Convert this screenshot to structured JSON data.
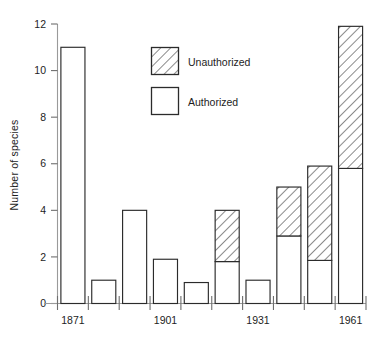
{
  "chart_data": {
    "type": "bar",
    "title": "",
    "subtitle": "",
    "xlabel": "",
    "ylabel": "Number of species",
    "ylim": [
      0,
      12
    ],
    "xlim": [
      1861,
      1971
    ],
    "grid": false,
    "stacked": true,
    "legend_position": "upper-center",
    "y_ticks": [
      "0",
      "2",
      "4",
      "6",
      "8",
      "10",
      "12"
    ],
    "y_tick_values": [
      0,
      2,
      4,
      6,
      8,
      10,
      12
    ],
    "x_tick_labels": [
      "1871",
      "1901",
      "1931",
      "1961"
    ],
    "x_tick_values": [
      1871,
      1901,
      1931,
      1961
    ],
    "categories": [
      "1871",
      "1881",
      "1891",
      "1901",
      "1911",
      "1921",
      "1931",
      "1941",
      "1951",
      "1961"
    ],
    "series": [
      {
        "name": "Authorized",
        "fill": "white",
        "values": [
          11,
          1,
          4,
          1.9,
          0.9,
          1.8,
          1,
          2.9,
          1.85,
          5.8
        ]
      },
      {
        "name": "Unauthorized",
        "fill": "hatched",
        "values": [
          0,
          0,
          0,
          0,
          0,
          2.2,
          0,
          2.1,
          4.05,
          6.1
        ]
      }
    ],
    "totals": [
      11,
      1,
      4,
      1.9,
      0.9,
      4,
      1,
      5,
      5.9,
      11.9
    ],
    "legend": [
      {
        "label": "Unauthorized",
        "swatch": "hatched"
      },
      {
        "label": "Authorized",
        "swatch": "white"
      }
    ]
  },
  "colors": {
    "background": "#ffffff",
    "ink": "#2b2b2b",
    "axis": "#9a9a9a",
    "text": "#1d1d1d"
  }
}
